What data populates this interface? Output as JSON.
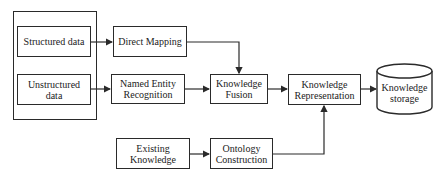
{
  "diagram": {
    "type": "flowchart",
    "title": "",
    "nodes": [
      {
        "id": "structured",
        "label": "Structured data"
      },
      {
        "id": "unstructured",
        "label": "Unstructured data"
      },
      {
        "id": "direct_mapping",
        "label": "Direct Mapping"
      },
      {
        "id": "ner",
        "label": "Named Entity Recognition"
      },
      {
        "id": "fusion",
        "label": "Knowledge Fusion"
      },
      {
        "id": "representation",
        "label": "Knowledge Representation"
      },
      {
        "id": "storage",
        "label": "Knowledge storage",
        "shape": "cylinder"
      },
      {
        "id": "existing",
        "label": "Existing Knowledge"
      },
      {
        "id": "ontology",
        "label": "Ontology Construction"
      }
    ],
    "edges": [
      {
        "from": "structured",
        "to": "direct_mapping"
      },
      {
        "from": "unstructured",
        "to": "ner"
      },
      {
        "from": "direct_mapping",
        "to": "fusion"
      },
      {
        "from": "ner",
        "to": "fusion"
      },
      {
        "from": "fusion",
        "to": "representation"
      },
      {
        "from": "representation",
        "to": "storage"
      },
      {
        "from": "existing",
        "to": "ontology"
      },
      {
        "from": "ontology",
        "to": "representation"
      }
    ],
    "groups": [
      {
        "id": "data_sources",
        "members": [
          "structured",
          "unstructured"
        ]
      }
    ]
  },
  "labels": {
    "structured_line1": "Structured data",
    "unstructured_line1": "Unstructured",
    "unstructured_line2": "data",
    "direct_mapping": "Direct Mapping",
    "ner_line1": "Named Entity",
    "ner_line2": "Recognition",
    "fusion_line1": "Knowledge",
    "fusion_line2": "Fusion",
    "repr_line1": "Knowledge",
    "repr_line2": "Representation",
    "storage_line1": "Knowledge",
    "storage_line2": "storage",
    "existing_line1": "Existing",
    "existing_line2": "Knowledge",
    "ontology_line1": "Ontology",
    "ontology_line2": "Construction"
  },
  "colors": {
    "stroke": "#2a2a2a",
    "fill": "#ffffff",
    "text": "#222222"
  }
}
